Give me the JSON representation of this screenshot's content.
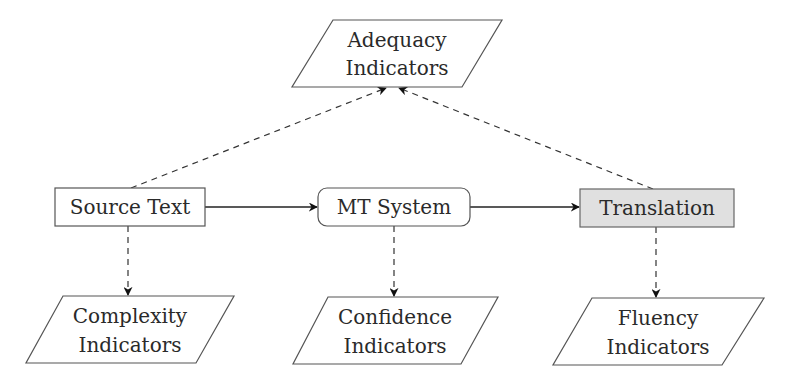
{
  "diagram": {
    "nodes": {
      "adequacy": {
        "line1": "Adequacy",
        "line2": "Indicators",
        "shape": "parallelogram"
      },
      "source": {
        "label": "Source Text",
        "shape": "rectangle"
      },
      "mt_system": {
        "label": "MT System",
        "shape": "rounded-rectangle"
      },
      "translation": {
        "label": "Translation",
        "shape": "rectangle",
        "fill": "#e0e0e0"
      },
      "complexity": {
        "line1": "Complexity",
        "line2": "Indicators",
        "shape": "parallelogram"
      },
      "confidence": {
        "line1": "Confidence",
        "line2": "Indicators",
        "shape": "parallelogram"
      },
      "fluency": {
        "line1": "Fluency",
        "line2": "Indicators",
        "shape": "parallelogram"
      }
    },
    "edges": [
      {
        "from": "Source Text",
        "to": "MT System",
        "style": "solid"
      },
      {
        "from": "MT System",
        "to": "Translation",
        "style": "solid"
      },
      {
        "from": "Source Text",
        "to": "Adequacy Indicators",
        "style": "dashed"
      },
      {
        "from": "Translation",
        "to": "Adequacy Indicators",
        "style": "dashed"
      },
      {
        "from": "Source Text",
        "to": "Complexity Indicators",
        "style": "dashed"
      },
      {
        "from": "MT System",
        "to": "Confidence Indicators",
        "style": "dashed"
      },
      {
        "from": "Translation",
        "to": "Fluency Indicators",
        "style": "dashed"
      }
    ],
    "colors": {
      "stroke": "#555555",
      "translation_fill": "#e0e0e0",
      "text": "#2a2a2a"
    }
  }
}
